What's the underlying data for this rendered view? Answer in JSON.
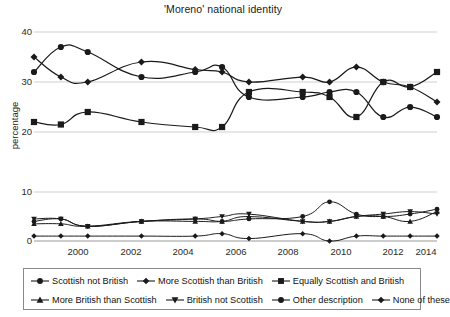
{
  "chart_data": {
    "type": "line",
    "title": "'Moreno' national identity",
    "xlabel": "",
    "ylabel": "percentage",
    "panels": [
      {
        "name": "upper-panel",
        "ylim": [
          20,
          40
        ],
        "yticks": [
          20,
          30,
          40
        ],
        "grid": true
      },
      {
        "name": "lower-panel",
        "ylim": [
          0,
          10
        ],
        "yticks": [
          0,
          10
        ],
        "grid": true
      }
    ],
    "xlim": [
      1999,
      2014
    ],
    "xticks": [
      2000,
      2002,
      2004,
      2006,
      2008,
      2010,
      2012,
      2014
    ],
    "x": [
      1999,
      2000,
      2001,
      2003,
      2005,
      2006,
      2007,
      2009,
      2010,
      2011,
      2012,
      2013,
      2014
    ],
    "legend_position": "bottom",
    "series": [
      {
        "name": "Scottish not British",
        "marker": "circle",
        "panel": "upper-panel",
        "values": [
          32.0,
          37.0,
          36.0,
          31.0,
          32.0,
          33.0,
          27.0,
          27.0,
          28.0,
          28.0,
          23.0,
          25.0,
          23.0
        ]
      },
      {
        "name": "More Scottish than British",
        "marker": "diamond",
        "panel": "upper-panel",
        "values": [
          35.0,
          31.0,
          30.0,
          34.0,
          32.5,
          32.0,
          30.0,
          31.0,
          30.0,
          33.0,
          30.0,
          29.0,
          26.0
        ]
      },
      {
        "name": "Equally Scottish and British",
        "marker": "square",
        "panel": "upper-panel",
        "values": [
          22.0,
          21.5,
          24.0,
          22.0,
          21.0,
          21.0,
          28.0,
          28.0,
          27.0,
          23.0,
          30.0,
          29.0,
          32.0
        ]
      },
      {
        "name": "More British than Scottish",
        "marker": "triangle-up",
        "panel": "lower-panel",
        "values": [
          3.5,
          3.5,
          3.0,
          4.0,
          4.0,
          4.0,
          5.0,
          4.0,
          4.0,
          5.0,
          5.0,
          4.0,
          6.0
        ]
      },
      {
        "name": "British not Scottish",
        "marker": "triangle-down",
        "panel": "lower-panel",
        "values": [
          4.5,
          4.5,
          3.0,
          4.0,
          4.5,
          5.0,
          5.5,
          4.0,
          4.0,
          5.0,
          5.5,
          6.0,
          5.5
        ]
      },
      {
        "name": "Other description",
        "marker": "circle",
        "panel": "lower-panel",
        "values": [
          4.0,
          4.5,
          3.0,
          4.0,
          4.5,
          4.0,
          4.5,
          5.0,
          8.0,
          5.5,
          5.0,
          5.5,
          6.5
        ]
      },
      {
        "name": "None of these",
        "marker": "diamond",
        "panel": "lower-panel",
        "values": [
          1.0,
          1.0,
          1.0,
          1.0,
          1.0,
          1.5,
          0.5,
          1.5,
          0.0,
          1.0,
          1.0,
          1.0,
          1.0
        ]
      }
    ]
  },
  "axis": {
    "ytick_40": "40",
    "ytick_30": "30",
    "ytick_20": "20",
    "ytick_10": "10",
    "ytick_0": "0",
    "ylabel": "percentage",
    "xtick_2000": "2000",
    "xtick_2002": "2002",
    "xtick_2004": "2004",
    "xtick_2006": "2006",
    "xtick_2008": "2008",
    "xtick_2010": "2010",
    "xtick_2012": "2012",
    "xtick_2014": "2014"
  },
  "legend": {
    "items": [
      {
        "label": "Scottish not British",
        "marker": "circle"
      },
      {
        "label": "More Scottish than British",
        "marker": "diamond"
      },
      {
        "label": "Equally Scottish and British",
        "marker": "square"
      },
      {
        "label": "More British than Scottish",
        "marker": "triangle-up"
      },
      {
        "label": "British not Scottish",
        "marker": "triangle-down"
      },
      {
        "label": "Other description",
        "marker": "circle"
      },
      {
        "label": "None of these",
        "marker": "diamond"
      }
    ]
  },
  "colors": {
    "line": "#1a1a1a",
    "grid": "#cfcfcf",
    "text": "#1a1a1a",
    "legend_border": "#8a8a8a",
    "background": "#ffffff"
  },
  "title": "'Moreno' national identity"
}
